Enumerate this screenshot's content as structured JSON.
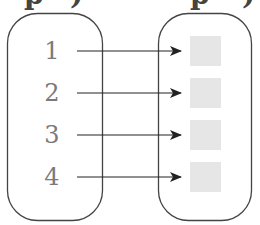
{
  "diagram": {
    "type": "mapping",
    "top_fragment": [
      "p",
      ")",
      "p",
      ")"
    ],
    "domain_set": {
      "elements": [
        "1",
        "2",
        "3",
        "4"
      ]
    },
    "codomain_set": {
      "elements": [
        "",
        "",
        "",
        ""
      ],
      "element_style": "gray-filled-square"
    },
    "arrows": [
      {
        "from": "1",
        "to": 0
      },
      {
        "from": "2",
        "to": 1
      },
      {
        "from": "3",
        "to": 2
      },
      {
        "from": "4",
        "to": 3
      }
    ],
    "colors": {
      "outline": "#444444",
      "number": "#7a7a7a",
      "square_fill": "#e6e6e6",
      "arrow": "#222222"
    }
  }
}
